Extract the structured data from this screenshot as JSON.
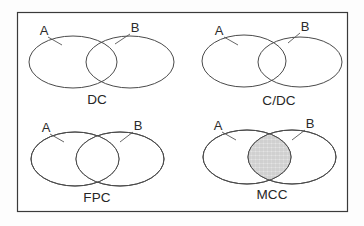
{
  "figure": {
    "background_color": "#fdfdfd",
    "frame_color": "#3a3a3a",
    "outline_color": "#4a4a4a",
    "label_color": "#262626"
  },
  "panels": [
    {
      "id": "dc",
      "label": "DC",
      "set_a_label": "A",
      "set_b_label": "B",
      "relation": "disconnected",
      "overlap": "tangent",
      "fill_a": "light-stipple",
      "fill_b": "light-stipple",
      "intersection_fill": "none"
    },
    {
      "id": "c-dc",
      "label": "C/DC",
      "set_a_label": "A",
      "set_b_label": "B",
      "relation": "connected-disconnected",
      "overlap": "tangent",
      "fill_a": "dense-vertical-hatch",
      "fill_b": "horizontal-dash",
      "intersection_fill": "none"
    },
    {
      "id": "fpc",
      "label": "FPC",
      "set_a_label": "A",
      "set_b_label": "B",
      "relation": "firm-partial-coincidence",
      "overlap": "lens",
      "fill_a": "vertical-line-hatch",
      "fill_b": "horizontal-dash",
      "intersection_fill": "white"
    },
    {
      "id": "mcc",
      "label": "MCC",
      "set_a_label": "A",
      "set_b_label": "B",
      "relation": "mutual-complete-coincidence",
      "overlap": "lens",
      "fill_a": "vertical-line-hatch",
      "fill_b": "horizontal-dash",
      "intersection_fill": "grey-crosshatch"
    }
  ]
}
